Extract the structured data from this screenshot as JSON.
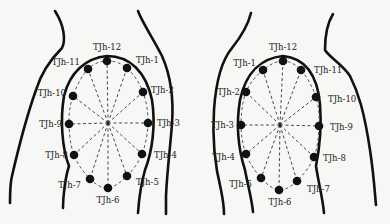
{
  "diagram": {
    "figures": [
      {
        "side": "left",
        "center": [
          108,
          123
        ],
        "points": [
          {
            "label": "TJh-12",
            "x": 107,
            "y": 61,
            "lx": 107,
            "ly": 50,
            "anchor": "middle"
          },
          {
            "label": "TJh-1",
            "x": 127,
            "y": 68,
            "lx": 136,
            "ly": 63,
            "anchor": "start"
          },
          {
            "label": "TJh-2",
            "x": 143,
            "y": 92,
            "lx": 151,
            "ly": 93,
            "anchor": "start"
          },
          {
            "label": "TJh-3",
            "x": 148,
            "y": 123,
            "lx": 157,
            "ly": 126,
            "anchor": "start"
          },
          {
            "label": "TJh-4",
            "x": 142,
            "y": 154,
            "lx": 154,
            "ly": 158,
            "anchor": "start"
          },
          {
            "label": "TJh-5",
            "x": 127,
            "y": 176,
            "lx": 136,
            "ly": 185,
            "anchor": "start"
          },
          {
            "label": "TJh-6",
            "x": 108,
            "y": 188,
            "lx": 108,
            "ly": 203,
            "anchor": "middle"
          },
          {
            "label": "TJh-7",
            "x": 90,
            "y": 179,
            "lx": 81,
            "ly": 188,
            "anchor": "end"
          },
          {
            "label": "TJh-8",
            "x": 74,
            "y": 155,
            "lx": 68,
            "ly": 158,
            "anchor": "end"
          },
          {
            "label": "TJh-9",
            "x": 69,
            "y": 124,
            "lx": 62,
            "ly": 127,
            "anchor": "end"
          },
          {
            "label": "TJh-10",
            "x": 73,
            "y": 96,
            "lx": 66,
            "ly": 96,
            "anchor": "end"
          },
          {
            "label": "TJh-11",
            "x": 88,
            "y": 69,
            "lx": 80,
            "ly": 65,
            "anchor": "end"
          }
        ]
      },
      {
        "side": "right",
        "center": [
          280,
          125
        ],
        "points": [
          {
            "label": "TJh-12",
            "x": 283,
            "y": 61,
            "lx": 283,
            "ly": 50,
            "anchor": "middle"
          },
          {
            "label": "TJh-1",
            "x": 263,
            "y": 70,
            "lx": 256,
            "ly": 66,
            "anchor": "end"
          },
          {
            "label": "TJh-2",
            "x": 246,
            "y": 92,
            "lx": 240,
            "ly": 95,
            "anchor": "end"
          },
          {
            "label": "TJh-3",
            "x": 241,
            "y": 125,
            "lx": 234,
            "ly": 128,
            "anchor": "end"
          },
          {
            "label": "TJh-4",
            "x": 246,
            "y": 154,
            "lx": 235,
            "ly": 160,
            "anchor": "end"
          },
          {
            "label": "TJh-5",
            "x": 261,
            "y": 178,
            "lx": 252,
            "ly": 187,
            "anchor": "end"
          },
          {
            "label": "TJh-6",
            "x": 279,
            "y": 190,
            "lx": 280,
            "ly": 205,
            "anchor": "middle"
          },
          {
            "label": "TJh-7",
            "x": 297,
            "y": 181,
            "lx": 307,
            "ly": 192,
            "anchor": "start"
          },
          {
            "label": "TJh-8",
            "x": 314,
            "y": 157,
            "lx": 323,
            "ly": 161,
            "anchor": "start"
          },
          {
            "label": "TJh-9",
            "x": 319,
            "y": 126,
            "lx": 330,
            "ly": 130,
            "anchor": "start"
          },
          {
            "label": "TJh-10",
            "x": 316,
            "y": 97,
            "lx": 328,
            "ly": 102,
            "anchor": "start"
          },
          {
            "label": "TJh-11",
            "x": 301,
            "y": 70,
            "lx": 314,
            "ly": 73,
            "anchor": "start"
          }
        ]
      }
    ]
  }
}
